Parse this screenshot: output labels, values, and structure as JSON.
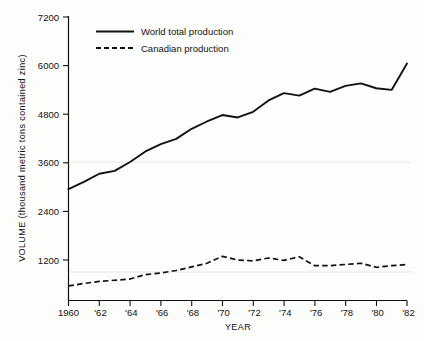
{
  "chart_data": {
    "type": "line",
    "title": "",
    "xlabel": "YEAR",
    "ylabel": "VOLUME (thousand metric tons contained zinc)",
    "xlim": [
      1960,
      1982
    ],
    "ylim": [
      0,
      7200
    ],
    "grid": false,
    "legend_position": "top-left-inside",
    "x": [
      1960,
      1961,
      1962,
      1963,
      1964,
      1965,
      1966,
      1967,
      1968,
      1969,
      1970,
      1971,
      1972,
      1973,
      1974,
      1975,
      1976,
      1977,
      1978,
      1979,
      1980,
      1981,
      1982
    ],
    "xtick_labels": [
      "1960",
      "'62",
      "'64",
      "'66",
      "'68",
      "'70",
      "'72",
      "'74",
      "'76",
      "'78",
      "'80",
      "'82"
    ],
    "xtick_values": [
      1960,
      1962,
      1964,
      1966,
      1968,
      1970,
      1972,
      1974,
      1976,
      1978,
      1980,
      1982
    ],
    "ytick_labels": [
      "7200",
      "6000",
      "4800",
      "3600",
      "2400",
      "1200"
    ],
    "ytick_values": [
      7200,
      6000,
      4800,
      3600,
      2400,
      1200
    ],
    "series": [
      {
        "name": "World total production",
        "style": "solid",
        "values": [
          2950,
          3130,
          3330,
          3400,
          3620,
          3880,
          4060,
          4190,
          4440,
          4620,
          4780,
          4720,
          4860,
          5140,
          5320,
          5260,
          5430,
          5350,
          5500,
          5560,
          5440,
          5400,
          6050
        ]
      },
      {
        "name": "Canadian production",
        "style": "dashed",
        "values": [
          560,
          620,
          670,
          700,
          730,
          840,
          880,
          940,
          1030,
          1120,
          1290,
          1200,
          1180,
          1250,
          1190,
          1280,
          1060,
          1060,
          1090,
          1120,
          1020,
          1060,
          1090
        ]
      }
    ]
  },
  "legend": {
    "entries": [
      {
        "label": "World total production",
        "style": "solid"
      },
      {
        "label": "Canadian production",
        "style": "dashed"
      }
    ]
  },
  "axes": {
    "x_title": "YEAR",
    "y_title": "VOLUME (thousand metric tons contained zinc)"
  }
}
